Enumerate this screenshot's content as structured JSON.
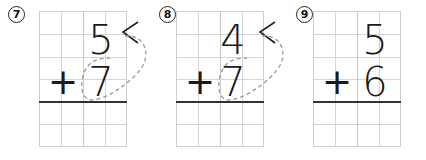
{
  "worksheet": {
    "problems": [
      {
        "number": "7",
        "top_digit": "5",
        "operator": "+",
        "bottom_digit": "7",
        "has_hint_marks": true
      },
      {
        "number": "8",
        "top_digit": "4",
        "operator": "+",
        "bottom_digit": "7",
        "has_hint_marks": true
      },
      {
        "number": "9",
        "top_digit": "5",
        "operator": "+",
        "bottom_digit": "6",
        "has_hint_marks": false
      }
    ],
    "colors": {
      "ink": "#1a1a1a",
      "grid_line": "#d6d6d6",
      "answer_line": "#333333",
      "dashed_hint": "#999999"
    }
  }
}
